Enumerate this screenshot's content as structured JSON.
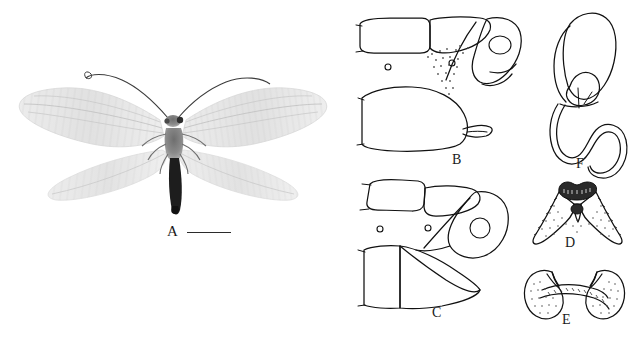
{
  "figure": {
    "type": "scientific-plate",
    "background_color": "#ffffff",
    "ink_color": "#111111",
    "panel_count": 6,
    "labels": {
      "a": "A",
      "b": "B",
      "c": "C",
      "d": "D",
      "e": "E",
      "f": "F"
    },
    "panels": [
      {
        "id": "A",
        "label": "A",
        "content": "habitus photograph of a winged lacewing, dorsal view, four membranous wings spread, long filamentous antennae, dark slender abdomen",
        "render": "grayscale-photograph",
        "has_scale_bar": true
      },
      {
        "id": "B",
        "label": "B",
        "content": "terminal abdominal segments, lateral view, with tergites, ectoproct and sternite bearing a small hook-like process",
        "render": "line-drawing"
      },
      {
        "id": "C",
        "label": "C",
        "content": "terminal abdominal segments, lateral view, with ectoproct bearing a large rounded callus cerci and a triangular sternite apex",
        "render": "line-drawing"
      },
      {
        "id": "D",
        "label": "D",
        "content": "gonarcus and mediuncus in posterior view, V-shaped arms with dark dentate apical cap and stippled shading",
        "render": "line-drawing-stippled"
      },
      {
        "id": "E",
        "label": "E",
        "content": "gonapophyses in ventral view, paired stippled lobes joined by an arched transverse bridge",
        "render": "line-drawing-stippled"
      },
      {
        "id": "F",
        "label": "F",
        "content": "spermatheca with rounded bursal sac and long sinuous coiled spermathecal duct",
        "render": "line-drawing"
      }
    ],
    "scale_bar": {
      "shown": true,
      "orientation": "horizontal",
      "position": "right of panel A label"
    }
  }
}
